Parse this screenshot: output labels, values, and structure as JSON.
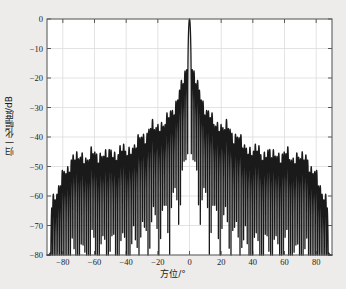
{
  "chart_data": {
    "type": "line",
    "title": "",
    "subtitle": "",
    "xlabel": "方位/°",
    "ylabel": "归一化幅度/dB",
    "xlim": [
      -90,
      90
    ],
    "ylim": [
      -80,
      0
    ],
    "xticks": [
      -80,
      -60,
      -40,
      -20,
      0,
      20,
      40,
      60,
      80
    ],
    "xticklabels": [
      "−80",
      "−60",
      "−40",
      "−20",
      "0",
      "20",
      "40",
      "60",
      "80"
    ],
    "yticks": [
      0,
      -10,
      -20,
      -30,
      -40,
      -50,
      -60,
      -70,
      -80
    ],
    "yticklabels": [
      "0",
      "−10",
      "−20",
      "−30",
      "−40",
      "−50",
      "−60",
      "−70",
      "−80"
    ],
    "grid": true,
    "legend": "none",
    "line_color": "#1a1a1a",
    "line_width": 1.3,
    "bg_color": "#ffffff",
    "page_color": "#edecea",
    "annotations": [
      {
        "text": "main lobe peak",
        "x": 0,
        "y": 0
      },
      {
        "text": "first sidelobe level",
        "x": 1.6,
        "y": -17
      },
      {
        "text": "edge lobe level",
        "x": 81,
        "y": -55
      }
    ],
    "sidelobe_envelope": {
      "x": [
        -90,
        -87,
        -81,
        -74,
        -67,
        -60,
        -52,
        -44,
        -36,
        -30,
        -24,
        -18,
        -12,
        -8,
        -5,
        -3,
        -1.6,
        0,
        1.6,
        3,
        5,
        8,
        12,
        18,
        24,
        30,
        36,
        44,
        52,
        60,
        67,
        74,
        81,
        87,
        90
      ],
      "y": [
        -80,
        -62,
        -55,
        -47,
        -47,
        -46,
        -46,
        -45,
        -44,
        -40,
        -37,
        -36,
        -33,
        -27,
        -23,
        -19,
        -17,
        0,
        -17,
        -19,
        -23,
        -27,
        -33,
        -36,
        -37,
        -40,
        -44,
        -45,
        -46,
        -46,
        -47,
        -47,
        -55,
        -62,
        -80
      ]
    },
    "null_floor_db": -80,
    "series": [
      {
        "name": "beampattern",
        "x_range": [
          -90,
          90
        ],
        "peak_db": 0,
        "peak_angle_deg": 0,
        "first_null_deg": 1.1,
        "mainlobe_3db_width_deg": 1.2,
        "sidelobe_count_per_side": 78
      }
    ]
  },
  "axes": {
    "x_label": "方位/°",
    "y_label": "归一化幅度/dB"
  }
}
